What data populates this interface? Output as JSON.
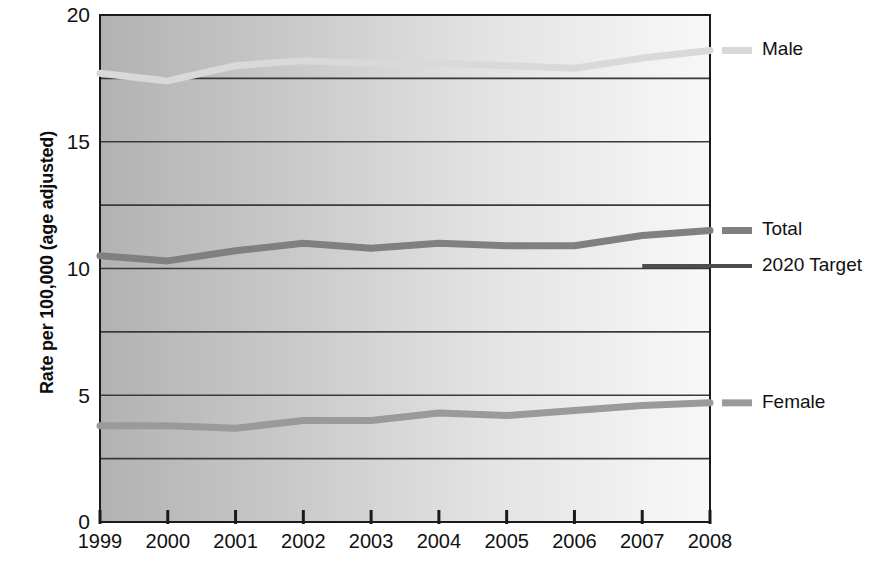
{
  "chart_data": {
    "type": "line",
    "title": "",
    "subtitle": "",
    "xlabel": "",
    "ylabel": "Rate per 100,000 (age adjusted)",
    "categories": [
      "1999",
      "2000",
      "2001",
      "2002",
      "2003",
      "2004",
      "2005",
      "2006",
      "2007",
      "2008"
    ],
    "x": [
      1999,
      2000,
      2001,
      2002,
      2003,
      2004,
      2005,
      2006,
      2007,
      2008
    ],
    "xlim": [
      1999,
      2008
    ],
    "ylim": [
      0,
      20
    ],
    "yticks": [
      0,
      5,
      10,
      15,
      20
    ],
    "ytick_labels": [
      "0",
      "5",
      "10",
      "15",
      "20"
    ],
    "gridlines_y": [
      0,
      2.5,
      5,
      7.5,
      10,
      12.5,
      15,
      17.5,
      20
    ],
    "grid": true,
    "legend_position": "right",
    "series": [
      {
        "name": "Male",
        "color": "#d9d9d9",
        "values": [
          17.7,
          17.4,
          18.0,
          18.2,
          18.1,
          18.1,
          18.0,
          17.9,
          18.3,
          18.6
        ]
      },
      {
        "name": "Total",
        "color": "#808080",
        "values": [
          10.5,
          10.3,
          10.7,
          11.0,
          10.8,
          11.0,
          10.9,
          10.9,
          11.3,
          11.5
        ]
      },
      {
        "name": "Female",
        "color": "#9a9a9a",
        "values": [
          3.8,
          3.8,
          3.7,
          4.0,
          4.0,
          4.3,
          4.2,
          4.4,
          4.6,
          4.7
        ]
      }
    ],
    "reference_lines": [
      {
        "name": "2020 Target",
        "color": "#4d4d4d",
        "value": 10.1,
        "x_start": 2007,
        "x_end": 2008
      }
    ],
    "legend": [
      {
        "label": "Male",
        "color": "#d9d9d9",
        "style": "short-dash"
      },
      {
        "label": "Total",
        "color": "#808080",
        "style": "short-dash"
      },
      {
        "label": "2020 Target",
        "color": "#4d4d4d",
        "style": "long-line"
      },
      {
        "label": "Female",
        "color": "#9a9a9a",
        "style": "short-dash"
      }
    ],
    "plot_background": {
      "gradient_from": "#b5b5b5",
      "gradient_to": "#f7f7f7",
      "direction": "left-to-right"
    },
    "axis_color": "#1a1a1a",
    "gridline_color": "#3a3a3a"
  }
}
